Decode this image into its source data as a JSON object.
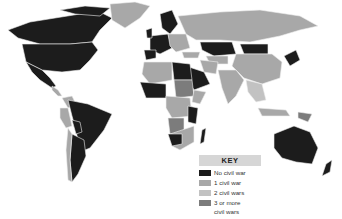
{
  "map": {
    "type": "choropleth world map",
    "title": "",
    "colors": {
      "no_civil_war": "#1c1c1c",
      "one_civil_war": "#a8a8a8",
      "two_civil_wars": "#c2c2c2",
      "three_or_more": "#7c7c7c",
      "ocean": "#ffffff",
      "border": "#e8e8e8"
    }
  },
  "key": {
    "title": "KEY",
    "items": [
      {
        "label": "No civil war",
        "color": "#1c1c1c"
      },
      {
        "label": "1 civil war",
        "color": "#a8a8a8"
      },
      {
        "label": "2 civil wars",
        "color": "#c2c2c2"
      },
      {
        "label": "3 or more",
        "label_line2": "civil wars",
        "color": "#7c7c7c"
      }
    ]
  }
}
